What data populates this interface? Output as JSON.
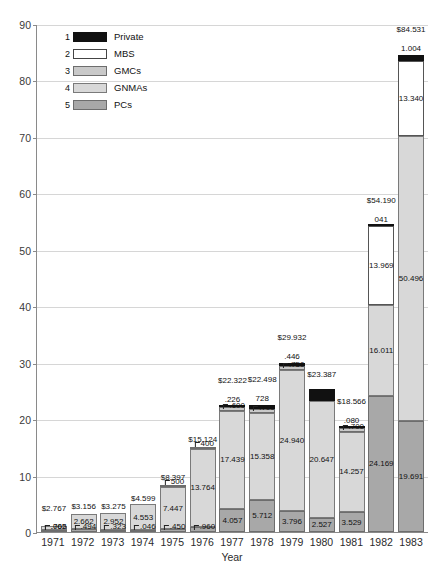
{
  "chart_data": {
    "type": "bar",
    "subtype": "stacked-bar",
    "title": "",
    "xlabel": "Year",
    "ylabel": "Billions of dollars",
    "ylim": [
      0,
      90
    ],
    "ytick_step": 10,
    "yticks": [
      0,
      10,
      20,
      30,
      40,
      50,
      60,
      70,
      80,
      90
    ],
    "grid": true,
    "legend_position": "top-left-inside",
    "categories": [
      "1971",
      "1972",
      "1973",
      "1974",
      "1975",
      "1976",
      "1977",
      "1978",
      "1979",
      "1980",
      "1981",
      "1982",
      "1983"
    ],
    "series": [
      {
        "name": "PCs",
        "legend_number": "5",
        "color": "#a8a8a8",
        "values": [
          0.065,
          0.494,
          0.323,
          0.046,
          0.45,
          0.96,
          4.057,
          5.712,
          3.796,
          2.527,
          3.529,
          24.169,
          19.691
        ],
        "labels": [
          ".065",
          ".494",
          ".323",
          ".046",
          ".450",
          ".960",
          "4.057",
          "5.712",
          "3.796",
          "2.527",
          "3.529",
          "24.169",
          "19.691"
        ]
      },
      {
        "name": "GNMAs",
        "legend_number": "4",
        "color": "#d8d8d8",
        "values": [
          0.702,
          2.662,
          2.952,
          4.553,
          7.447,
          13.764,
          17.439,
          15.358,
          24.94,
          20.647,
          14.257,
          16.011,
          50.496
        ],
        "labels": [
          ".702",
          "2.662",
          "2.952",
          "4.553",
          "7.447",
          "13.764",
          "17.439",
          "15.358",
          "24.940",
          "20.647",
          "14.257",
          "16.011",
          "50.496"
        ]
      },
      {
        "name": "GMCs",
        "legend_number": "3",
        "color": "#c9c9c9",
        "values": [
          0,
          0,
          0,
          0,
          0.5,
          0.4,
          0.6,
          0.7,
          0.75,
          0,
          0.7,
          0,
          0
        ],
        "labels": [
          "",
          "",
          "",
          "",
          "500",
          "400",
          ".600",
          ".700",
          ".750",
          "",
          ".700",
          "",
          ""
        ]
      },
      {
        "name": "MBS",
        "legend_number": "2",
        "color": "#ffffff",
        "values": [
          0,
          0,
          0,
          0,
          0,
          0,
          0,
          0,
          0,
          0,
          0,
          13.969,
          13.34
        ],
        "labels": [
          "",
          "",
          "",
          "",
          "",
          "",
          "",
          "",
          "",
          "",
          "",
          "13.969",
          "13.340"
        ]
      },
      {
        "name": "Private",
        "legend_number": "1",
        "color": "#111111",
        "values": [
          0,
          0,
          0,
          0,
          0,
          0,
          0.226,
          0.728,
          0.446,
          2.13,
          0.08,
          0.041,
          1.004
        ],
        "labels": [
          "",
          "",
          "",
          "",
          "",
          "",
          ".226",
          "728",
          ".446",
          "2.13",
          ".080",
          "041",
          "1.004"
        ]
      }
    ],
    "totals": [
      2.767,
      3.156,
      3.275,
      4.599,
      8.397,
      15.124,
      22.322,
      22.498,
      29.932,
      23.387,
      18.566,
      54.19,
      84.531
    ],
    "total_labels": [
      "$2.767",
      "$3.156",
      "$3.275",
      "$4.599",
      "$8.397",
      "$15.124",
      "$22.322",
      "$22.498",
      "$29.932",
      "$23.387",
      "$18.566",
      "$54.190",
      "$84.531"
    ]
  },
  "legend": {
    "items": [
      {
        "num": "1",
        "label": "Private",
        "key": "private"
      },
      {
        "num": "2",
        "label": "MBS",
        "key": "mbs"
      },
      {
        "num": "3",
        "label": "GMCs",
        "key": "gmc"
      },
      {
        "num": "4",
        "label": "GNMAs",
        "key": "gnma"
      },
      {
        "num": "5",
        "label": "PCs",
        "key": "pc"
      }
    ]
  }
}
